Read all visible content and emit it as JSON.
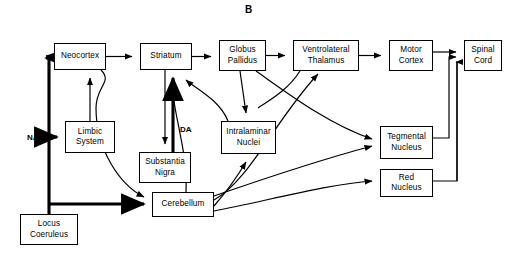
{
  "figure": {
    "panel_label": "B",
    "panel_label_pos": {
      "x": 245,
      "y": 4
    },
    "width": 514,
    "height": 255,
    "line_color": "#000000",
    "background": "#ffffff"
  },
  "nodes": [
    {
      "id": "neocortex",
      "label": "Neocortex",
      "x": 54,
      "y": 43,
      "w": 52,
      "h": 27
    },
    {
      "id": "striatum",
      "label": "Striatum",
      "x": 140,
      "y": 43,
      "w": 52,
      "h": 27
    },
    {
      "id": "globus-pallidus",
      "label": "Globus\nPallidus",
      "x": 219,
      "y": 40,
      "w": 47,
      "h": 31
    },
    {
      "id": "ventrolateral-thalamus",
      "label": "Ventrolateral\nThalamus",
      "x": 293,
      "y": 40,
      "w": 66,
      "h": 31
    },
    {
      "id": "motor-cortex",
      "label": "Motor\nCortex",
      "x": 389,
      "y": 40,
      "w": 44,
      "h": 31
    },
    {
      "id": "spinal-cord",
      "label": "Spinal\nCord",
      "x": 464,
      "y": 40,
      "w": 38,
      "h": 31
    },
    {
      "id": "limbic-system",
      "label": "Limbic\nSystem",
      "x": 65,
      "y": 121,
      "w": 50,
      "h": 32
    },
    {
      "id": "substantia-nigra",
      "label": "Substantia\nNigra",
      "x": 139,
      "y": 152,
      "w": 52,
      "h": 31
    },
    {
      "id": "intralaminar-nuclei",
      "label": "Intralaminar\nNuclei",
      "x": 221,
      "y": 121,
      "w": 55,
      "h": 33
    },
    {
      "id": "tegmental-nucleus",
      "label": "Tegmental\nNucleus",
      "x": 380,
      "y": 126,
      "w": 53,
      "h": 33
    },
    {
      "id": "red-nucleus",
      "label": "Red\nNucleus",
      "x": 380,
      "y": 169,
      "w": 53,
      "h": 28
    },
    {
      "id": "cerebellum",
      "label": "Cerebellum",
      "x": 152,
      "y": 192,
      "w": 62,
      "h": 25
    },
    {
      "id": "locus-coeruleus",
      "label": "Locus\nCoeruleus",
      "x": 20,
      "y": 214,
      "w": 58,
      "h": 31
    }
  ],
  "edge_labels": [
    {
      "id": "na",
      "text": "NA",
      "x": 27,
      "y": 134
    },
    {
      "id": "da",
      "text": "DA",
      "x": 180,
      "y": 126
    }
  ],
  "connections": [
    {
      "from": "neocortex",
      "to": "striatum",
      "type": "thin"
    },
    {
      "from": "striatum",
      "to": "globus-pallidus",
      "type": "thin"
    },
    {
      "from": "globus-pallidus",
      "to": "ventrolateral-thalamus",
      "type": "thin"
    },
    {
      "from": "ventrolateral-thalamus",
      "to": "motor-cortex",
      "type": "thin"
    },
    {
      "from": "motor-cortex",
      "to": "spinal-cord",
      "type": "thin"
    },
    {
      "from": "limbic-system",
      "to": "neocortex",
      "type": "thin"
    },
    {
      "from": "striatum",
      "to": "substantia-nigra",
      "type": "thin"
    },
    {
      "from": "substantia-nigra",
      "to": "striatum",
      "type": "thick",
      "label": "DA"
    },
    {
      "from": "locus-coeruleus",
      "to": "neocortex",
      "type": "thick",
      "label": "NA"
    },
    {
      "from": "locus-coeruleus",
      "to": "limbic-system",
      "type": "thick",
      "label": "NA"
    },
    {
      "from": "locus-coeruleus",
      "to": "cerebellum",
      "type": "thick",
      "label": "NA"
    },
    {
      "from": "neocortex",
      "to": "cerebellum",
      "type": "thin"
    },
    {
      "from": "cerebellum",
      "to": "striatum",
      "type": "thin"
    },
    {
      "from": "cerebellum",
      "to": "ventrolateral-thalamus",
      "type": "thin"
    },
    {
      "from": "cerebellum",
      "to": "intralaminar-nuclei",
      "type": "thin"
    },
    {
      "from": "cerebellum",
      "to": "red-nucleus",
      "type": "thin"
    },
    {
      "from": "cerebellum",
      "to": "tegmental-nucleus",
      "type": "thin"
    },
    {
      "from": "globus-pallidus",
      "to": "intralaminar-nuclei",
      "type": "thin"
    },
    {
      "from": "globus-pallidus",
      "to": "tegmental-nucleus",
      "type": "thin"
    },
    {
      "from": "intralaminar-nuclei",
      "to": "striatum",
      "type": "thin"
    },
    {
      "from": "tegmental-nucleus",
      "to": "spinal-cord",
      "type": "thin"
    },
    {
      "from": "red-nucleus",
      "to": "spinal-cord",
      "type": "thin"
    }
  ]
}
